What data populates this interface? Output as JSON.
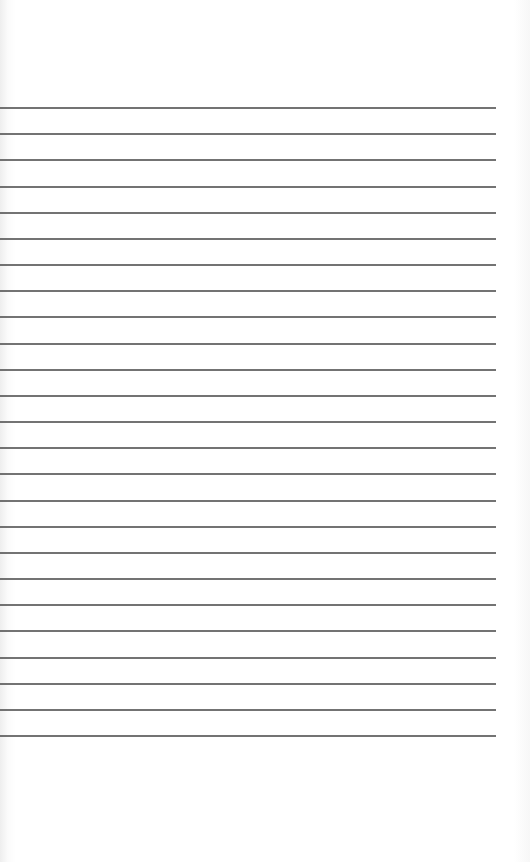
{
  "page": {
    "type": "lined-paper",
    "background_color": "#ffffff",
    "rule_color": "#5a5a5a",
    "rule_count": 25,
    "first_rule_y": 108,
    "rule_spacing": 26.17,
    "rule_left": 0,
    "rule_right": 496
  }
}
